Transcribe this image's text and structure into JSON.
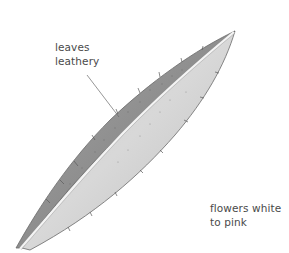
{
  "illustration": {
    "subject": "leaf",
    "colors": {
      "background": "#ffffff",
      "leaf_dark": "#8c8c8c",
      "leaf_mid": "#b5b5b5",
      "leaf_light": "#d9d9d9",
      "midrib": "#f2f2f2",
      "outline": "#6a6a6a",
      "text": "#4a4a4a",
      "leader_line": "#6a6a6a"
    }
  },
  "annotations": [
    {
      "id": "leaves",
      "lines": [
        "leaves",
        "leathery"
      ]
    },
    {
      "id": "flowers",
      "lines": [
        "flowers white",
        "to pink"
      ]
    }
  ]
}
